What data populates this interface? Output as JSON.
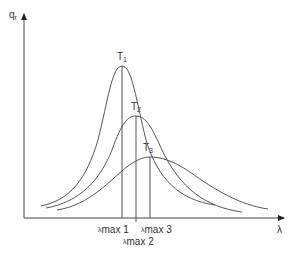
{
  "diagram": {
    "y_axis_label": "q",
    "y_axis_subscript": "r",
    "x_axis_label": "λ",
    "curves": [
      {
        "name": "T",
        "sub": "1",
        "peak_x": 122,
        "peak_y": 66
      },
      {
        "name": "T",
        "sub": "2",
        "peak_x": 136,
        "peak_y": 116
      },
      {
        "name": "T",
        "sub": "3",
        "peak_x": 150,
        "peak_y": 157
      }
    ],
    "peak_markers": [
      {
        "label": "λ",
        "sub": "max 1"
      },
      {
        "label": "λ",
        "sub": "max 2"
      },
      {
        "label": "λ",
        "sub": "max 3"
      }
    ],
    "colors": {
      "line": "#444444",
      "text": "#333333",
      "background": "#ffffff"
    }
  }
}
